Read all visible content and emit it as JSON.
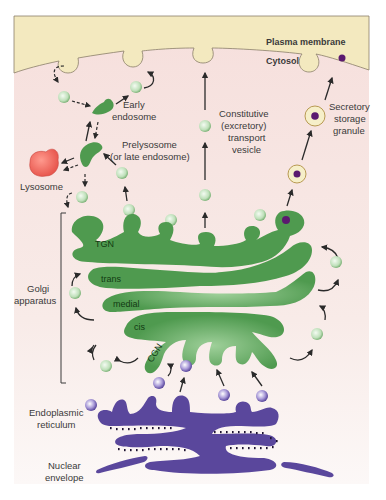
{
  "diagram": {
    "colors": {
      "plasma_membrane": "#f3e9bf",
      "cytosol": "#f7e3e0",
      "cytosol_lower": "#faf3f1",
      "golgi": "#4f9a4f",
      "er": "#5a479c",
      "lysosome": "#ef6b60",
      "vesicle_green": "#d3ecd0",
      "vesicle_purple": "#8f7fc9",
      "granule": "#f6efc9",
      "granule_core": "#5b1a6f"
    },
    "labels": {
      "plasma_membrane": "Plasma membrane",
      "cytosol": "Cytosol",
      "early_endosome": [
        "Early",
        "endosome"
      ],
      "prelysosome": [
        "Prelysosome",
        "(or late endosome)"
      ],
      "lysosome": "Lysosome",
      "constitutive_vesicle": [
        "Constitutive",
        "(excretory)",
        "transport",
        "vesicle"
      ],
      "secretory_granule": [
        "Secretory",
        "storage",
        "granule"
      ],
      "golgi_apparatus": [
        "Golgi",
        "apparatus"
      ],
      "tgn": "TGN",
      "trans": "trans",
      "medial": "medial",
      "cis": "cis",
      "cgn": "CGN",
      "er": [
        "Endoplasmic",
        "reticulum"
      ],
      "nuclear_envelope": [
        "Nuclear",
        "envelope"
      ]
    }
  }
}
